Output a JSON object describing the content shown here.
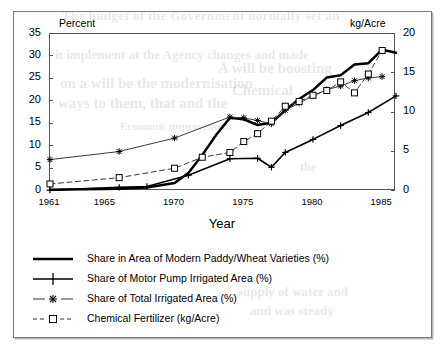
{
  "chart_data": {
    "type": "line",
    "title": "",
    "xlabel": "Year",
    "left_axis_label": "Percent",
    "right_axis_label": "kg/Acre",
    "xlim": [
      1961,
      1986
    ],
    "ylim_left": [
      0,
      35
    ],
    "ylim_right": [
      0,
      20
    ],
    "xticks": [
      1961,
      1965,
      1970,
      1975,
      1980,
      1985
    ],
    "yticks_left": [
      0,
      5,
      10,
      15,
      20,
      25,
      30,
      35
    ],
    "yticks_right": [
      0,
      5,
      10,
      15,
      20
    ],
    "grid": false,
    "legend_position": "below",
    "series": [
      {
        "name": "Share in Area of Modern Paddy/Wheat Varieties (%)",
        "axis": "left",
        "marker": "none",
        "line": "solid-thick",
        "x": [
          1961,
          1966,
          1968,
          1970,
          1971,
          1972,
          1973,
          1974,
          1975,
          1976,
          1977,
          1978,
          1979,
          1980,
          1981,
          1982,
          1983,
          1984,
          1985,
          1986
        ],
        "y": [
          0.3,
          0.5,
          0.8,
          1.8,
          4.0,
          8.0,
          12.5,
          16.3,
          16.0,
          14.7,
          15.2,
          18.0,
          20.5,
          22.5,
          25.3,
          25.8,
          28.2,
          28.5,
          31.5,
          30.8
        ]
      },
      {
        "name": "Share of Motor Pump Irrigated Area (%)",
        "axis": "left",
        "marker": "plus",
        "line": "solid",
        "x": [
          1961,
          1966,
          1968,
          1971,
          1974,
          1976,
          1977,
          1978,
          1980,
          1982,
          1984,
          1986
        ],
        "y": [
          0.2,
          0.8,
          1.0,
          3.5,
          7.2,
          7.3,
          5.3,
          8.6,
          11.5,
          14.6,
          17.5,
          21.2
        ]
      },
      {
        "name": "Share of Total Irrigated Area (%)",
        "axis": "left",
        "marker": "asterisk",
        "line": "solid-thin",
        "x": [
          1961,
          1966,
          1970,
          1974,
          1975,
          1976,
          1977,
          1978,
          1979,
          1980,
          1981,
          1982,
          1983,
          1984,
          1985
        ],
        "y": [
          7.0,
          8.8,
          11.8,
          16.5,
          16.3,
          15.7,
          15.0,
          18.0,
          19.6,
          21.2,
          22.6,
          23.4,
          24.6,
          25.2,
          25.5
        ]
      },
      {
        "name": "Chemical Fertilizer (kg/Acre)",
        "axis": "right",
        "marker": "square",
        "line": "dashed",
        "x": [
          1961,
          1966,
          1970,
          1972,
          1974,
          1975,
          1976,
          1977,
          1978,
          1979,
          1980,
          1981,
          1982,
          1983,
          1984,
          1985
        ],
        "y": [
          0.9,
          1.7,
          2.9,
          4.3,
          4.9,
          6.3,
          7.3,
          8.9,
          10.8,
          11.4,
          12.2,
          12.8,
          13.9,
          12.5,
          14.9,
          17.9
        ]
      }
    ]
  },
  "ghost_text": {
    "l1": "The budget of the Government normally set an",
    "l2": "it implement at the Agency changes and made",
    "l3": "on a will be the modernisation",
    "l4": "ways to them, that and the",
    "l5": "Economic improvement",
    "l6": "A will be boosting",
    "l7": "Chemical",
    "l8": "the",
    "l9": "supply of water and",
    "l10": "and was steady"
  },
  "colors": {
    "ink": "#000000",
    "axis": "#555555",
    "frame": "#7a7a7a",
    "thin": "#5a5a5a",
    "background": "#ffffff"
  }
}
